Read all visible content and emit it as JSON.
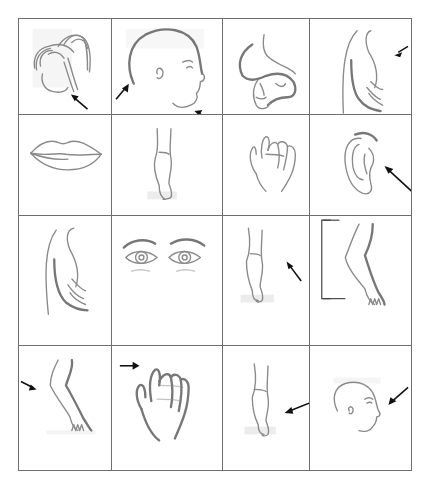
{
  "worksheet": {
    "type": "body-parts picture grid",
    "rows": 4,
    "columns": 4,
    "cells": [
      {
        "row": 1,
        "col": 1,
        "picture": "hair-ponytail",
        "arrow": true
      },
      {
        "row": 1,
        "col": 2,
        "picture": "bald-head-profile",
        "arrow": true,
        "arrows": 2
      },
      {
        "row": 1,
        "col": 3,
        "picture": "foot",
        "arrow": true
      },
      {
        "row": 1,
        "col": 4,
        "picture": "back-torso",
        "arrow": true
      },
      {
        "row": 2,
        "col": 1,
        "picture": "lips",
        "arrow": false
      },
      {
        "row": 2,
        "col": 2,
        "picture": "leg",
        "arrow": false
      },
      {
        "row": 2,
        "col": 3,
        "picture": "hand",
        "arrow": false
      },
      {
        "row": 2,
        "col": 4,
        "picture": "ear",
        "arrow": true
      },
      {
        "row": 3,
        "col": 1,
        "picture": "back-torso",
        "arrow": false
      },
      {
        "row": 3,
        "col": 2,
        "picture": "eyes-eyebrows",
        "arrow": false
      },
      {
        "row": 3,
        "col": 3,
        "picture": "leg",
        "arrow": true
      },
      {
        "row": 3,
        "col": 4,
        "picture": "bent-leg",
        "arrow": false,
        "bracket": true
      },
      {
        "row": 4,
        "col": 1,
        "picture": "bent-leg",
        "arrow": true
      },
      {
        "row": 4,
        "col": 2,
        "picture": "hand",
        "arrow": true
      },
      {
        "row": 4,
        "col": 3,
        "picture": "leg",
        "arrow": true
      },
      {
        "row": 4,
        "col": 4,
        "picture": "head-profile",
        "arrow": true
      }
    ]
  }
}
